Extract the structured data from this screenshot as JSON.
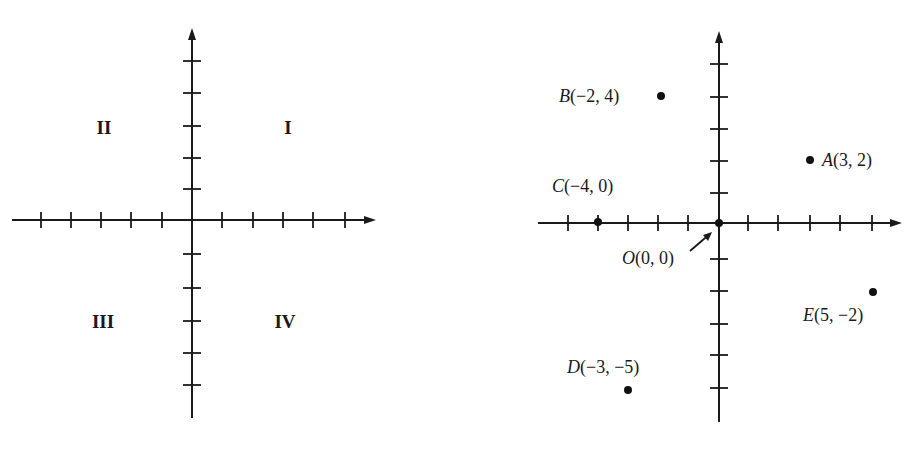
{
  "left_plane": {
    "origin": [
      192,
      220
    ],
    "x_axis": {
      "from": 12,
      "to": 376
    },
    "y_axis": {
      "from": 418,
      "to": 28
    },
    "x_ticks": [
      41,
      71,
      101,
      131,
      162,
      222,
      253,
      283,
      313,
      345
    ],
    "y_ticks": [
      61,
      93,
      126,
      158,
      189,
      254,
      288,
      321,
      353,
      385
    ],
    "quadrants": [
      {
        "id": "I",
        "label": "I",
        "x": 288,
        "y": 134
      },
      {
        "id": "II",
        "label": "II",
        "x": 104,
        "y": 134
      },
      {
        "id": "III",
        "label": "III",
        "x": 103,
        "y": 328
      },
      {
        "id": "IV",
        "label": "IV",
        "x": 285,
        "y": 328
      }
    ]
  },
  "right_plane": {
    "origin": [
      719,
      223
    ],
    "x_axis": {
      "from": 538,
      "to": 902
    },
    "y_axis": {
      "from": 422,
      "to": 31
    },
    "x_ticks": [
      568,
      598,
      628,
      658,
      688,
      748,
      778,
      810,
      840,
      872
    ],
    "y_ticks": [
      64,
      97,
      129,
      161,
      193,
      259,
      291,
      324,
      355,
      388
    ],
    "points": [
      {
        "name": "A",
        "coords": "(3, 2)",
        "x": 3,
        "y": 2,
        "px": 810,
        "py": 160,
        "label_x": 822,
        "label_y": 166,
        "anchor": "start"
      },
      {
        "name": "B",
        "coords": "(−2, 4)",
        "x": -2,
        "y": 4,
        "px": 661,
        "py": 96,
        "label_x": 559,
        "label_y": 102,
        "anchor": "start"
      },
      {
        "name": "C",
        "coords": "(−4, 0)",
        "x": -4,
        "y": 0,
        "px": 598,
        "py": 222,
        "label_x": 552,
        "label_y": 192,
        "anchor": "start"
      },
      {
        "name": "D",
        "coords": "(−3, −5)",
        "x": -3,
        "y": -5,
        "px": 628,
        "py": 390,
        "label_x": 567,
        "label_y": 373,
        "anchor": "start"
      },
      {
        "name": "E",
        "coords": "(5, −2)",
        "x": 5,
        "y": -2,
        "px": 873,
        "py": 292,
        "label_x": 803,
        "label_y": 321,
        "anchor": "start"
      },
      {
        "name": "O",
        "coords": "(0, 0)",
        "x": 0,
        "y": 0,
        "px": 719,
        "py": 223,
        "label_x": 622,
        "label_y": 264,
        "anchor": "start"
      }
    ],
    "origin_pointer": {
      "x1": 690,
      "y1": 251,
      "x2": 712,
      "y2": 232
    }
  },
  "chart_data": [
    {
      "type": "scatter",
      "title": "Coordinate plane quadrants",
      "xlabel": "",
      "ylabel": "",
      "xlim": [
        -6,
        6
      ],
      "ylim": [
        -6,
        6
      ],
      "grid": false,
      "annotations": [
        "I",
        "II",
        "III",
        "IV"
      ],
      "quadrant_labels": {
        "I": "upper-right",
        "II": "upper-left",
        "III": "lower-left",
        "IV": "lower-right"
      }
    },
    {
      "type": "scatter",
      "title": "Plotted points",
      "xlabel": "",
      "ylabel": "",
      "xlim": [
        -6,
        6
      ],
      "ylim": [
        -6,
        6
      ],
      "grid": false,
      "series": [
        {
          "name": "points",
          "values": [
            {
              "label": "A",
              "x": 3,
              "y": 2
            },
            {
              "label": "B",
              "x": -2,
              "y": 4
            },
            {
              "label": "C",
              "x": -4,
              "y": 0
            },
            {
              "label": "D",
              "x": -3,
              "y": -5
            },
            {
              "label": "E",
              "x": 5,
              "y": -2
            },
            {
              "label": "O",
              "x": 0,
              "y": 0
            }
          ]
        }
      ],
      "annotations": [
        "A(3, 2)",
        "B(−2, 4)",
        "C(−4, 0)",
        "D(−3, −5)",
        "E(5, −2)",
        "O(0, 0)"
      ]
    }
  ]
}
